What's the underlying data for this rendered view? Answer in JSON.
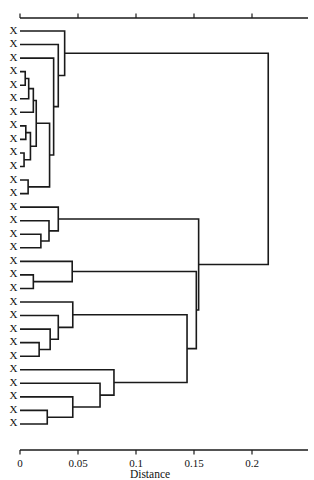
{
  "chart_data": {
    "type": "dendrogram",
    "title": "",
    "subtitle": "",
    "xlabel": "Distance",
    "ylabel": "",
    "xlim": [
      0,
      0.243
    ],
    "ylim": [
      0,
      30
    ],
    "grid": false,
    "legend": null,
    "orientation": "horizontal-left-to-right",
    "xticks": [
      0,
      0.05,
      0.1,
      0.15,
      0.2
    ],
    "xticklabels": [
      "0",
      "0.05",
      "0.1",
      "0.15",
      "0.2"
    ],
    "axis_top": true,
    "axis_bottom": true,
    "leaf_count": 30,
    "leaf_labels": [
      "X",
      "X",
      "X",
      "X",
      "X",
      "X",
      "X",
      "X",
      "X",
      "X",
      "X",
      "X",
      "X",
      "X",
      "X",
      "X",
      "X",
      "X",
      "X",
      "X",
      "X",
      "X",
      "X",
      "X",
      "X",
      "X",
      "X",
      "X",
      "X",
      "X"
    ],
    "line_color": "#1a1a1a",
    "background_color": "#ffffff",
    "merges": [
      {
        "id": "m1",
        "left": "leaf4",
        "right": "leaf5",
        "distance": 0.0045
      },
      {
        "id": "m2",
        "left": "m1",
        "right": "leaf6",
        "distance": 0.0075
      },
      {
        "id": "m3",
        "left": "leaf8",
        "right": "leaf9",
        "distance": 0.005
      },
      {
        "id": "m4",
        "left": "leaf10",
        "right": "leaf11",
        "distance": 0.0035
      },
      {
        "id": "m5",
        "left": "m4",
        "right": "m3",
        "distance": 0.009
      },
      {
        "id": "m6",
        "left": "m2",
        "right": "leaf7",
        "distance": 0.0115
      },
      {
        "id": "m7",
        "left": "m6",
        "right": "m5",
        "distance": 0.014
      },
      {
        "id": "m8",
        "left": "leaf12",
        "right": "leaf13",
        "distance": 0.007
      },
      {
        "id": "m9",
        "left": "m7",
        "right": "m8",
        "distance": 0.0255
      },
      {
        "id": "m10",
        "left": "m9",
        "right": "leaf3",
        "distance": 0.029
      },
      {
        "id": "m11",
        "left": "m10",
        "right": "leaf2",
        "distance": 0.033
      },
      {
        "id": "m12",
        "left": "m11",
        "right": "leaf1",
        "distance": 0.0385
      },
      {
        "id": "m13",
        "left": "leaf16",
        "right": "leaf17",
        "distance": 0.018
      },
      {
        "id": "m14",
        "left": "m13",
        "right": "leaf15",
        "distance": 0.025
      },
      {
        "id": "m15",
        "left": "m14",
        "right": "leaf14",
        "distance": 0.033
      },
      {
        "id": "m16",
        "left": "leaf19",
        "right": "leaf20",
        "distance": 0.0115
      },
      {
        "id": "m17",
        "left": "m16",
        "right": "leaf18",
        "distance": 0.045
      },
      {
        "id": "m18",
        "left": "leaf24",
        "right": "leaf25",
        "distance": 0.0165
      },
      {
        "id": "m19",
        "left": "m18",
        "right": "leaf23",
        "distance": 0.026
      },
      {
        "id": "m20",
        "left": "m19",
        "right": "leaf22",
        "distance": 0.033
      },
      {
        "id": "m21",
        "left": "m20",
        "right": "leaf21",
        "distance": 0.0455
      },
      {
        "id": "m22",
        "left": "leaf29",
        "right": "leaf30",
        "distance": 0.0235
      },
      {
        "id": "m23",
        "left": "m22",
        "right": "leaf28",
        "distance": 0.0455
      },
      {
        "id": "m24",
        "left": "m23",
        "right": "leaf27",
        "distance": 0.069
      },
      {
        "id": "m25",
        "left": "m24",
        "right": "leaf26",
        "distance": 0.081
      },
      {
        "id": "m26",
        "left": "m21",
        "right": "m25",
        "distance": 0.144
      },
      {
        "id": "m27",
        "left": "m17",
        "right": "m26",
        "distance": 0.152
      },
      {
        "id": "m28",
        "left": "m15",
        "right": "m27",
        "distance": 0.154
      },
      {
        "id": "m29",
        "left": "m12",
        "right": "m28",
        "distance": 0.214
      }
    ],
    "clusters_visual": [
      {
        "name": "cluster-1",
        "leaves": 13,
        "merge_height": 0.0385
      },
      {
        "name": "cluster-2",
        "leaves": 4,
        "merge_height": 0.033
      },
      {
        "name": "cluster-3",
        "leaves": 3,
        "merge_height": 0.045
      },
      {
        "name": "cluster-4",
        "leaves": 5,
        "merge_height": 0.0455
      },
      {
        "name": "cluster-5",
        "leaves": 5,
        "merge_height": 0.081
      }
    ]
  },
  "figure": {
    "axis_title": "Distance",
    "leaf_label": "X"
  }
}
